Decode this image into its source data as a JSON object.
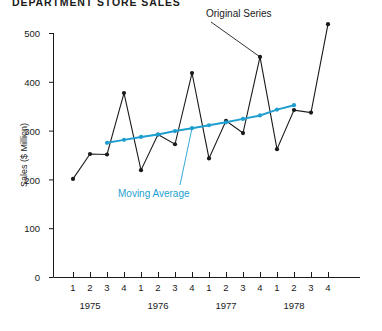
{
  "chart_data": {
    "type": "line",
    "title": "DEPARTMENT STORE SALES",
    "xlabel": "",
    "ylabel": "Sales  ($ Million)",
    "ylim": [
      0,
      500
    ],
    "ytick_values": [
      0,
      100,
      200,
      300,
      400,
      500
    ],
    "ytick_labels": [
      "0",
      "100",
      "200",
      "300",
      "400",
      "500"
    ],
    "grid": false,
    "legend_position": "annotations-inline",
    "categories": [
      "1975 Q1",
      "1975 Q2",
      "1975 Q3",
      "1975 Q4",
      "1976 Q1",
      "1976 Q2",
      "1976 Q3",
      "1976 Q4",
      "1977 Q1",
      "1977 Q2",
      "1977 Q3",
      "1977 Q4",
      "1978 Q1",
      "1978 Q2",
      "1978 Q3",
      "1978 Q4"
    ],
    "quarter_labels": [
      "1",
      "2",
      "3",
      "4",
      "1",
      "2",
      "3",
      "4",
      "1",
      "2",
      "3",
      "4",
      "1",
      "2",
      "3",
      "4"
    ],
    "year_labels": [
      "1975",
      "1976",
      "1977",
      "1978"
    ],
    "series": [
      {
        "name": "Original Series",
        "color": "#1a1a1a",
        "marker": "filled-circle",
        "values": [
          201,
          252,
          251,
          377,
          219,
          292,
          272,
          418,
          243,
          320,
          295,
          451,
          262,
          342,
          337,
          518
        ]
      },
      {
        "name": "Moving Average",
        "color": "#1f9fd0",
        "marker": "filled-circle",
        "start_index": 2,
        "end_index": 13,
        "values": [
          null,
          null,
          275,
          281,
          287,
          292,
          299,
          305,
          311,
          317,
          324,
          331,
          343,
          352,
          null,
          null
        ]
      }
    ],
    "annotations": [
      {
        "text": "Original Series",
        "color": "#1a1a1a",
        "points_to": "1977 Q4"
      },
      {
        "text": "Moving Average",
        "color": "#1f9fd0",
        "points_to": "1976 Q4"
      }
    ]
  },
  "axis": {
    "y_title": "Sales  ($ Million)",
    "y_ticks": [
      "500",
      "400",
      "300",
      "200",
      "100",
      "0"
    ],
    "x_quarters": [
      "1",
      "2",
      "3",
      "4",
      "1",
      "2",
      "3",
      "4",
      "1",
      "2",
      "3",
      "4",
      "1",
      "2",
      "3",
      "4"
    ],
    "x_years": [
      "1975",
      "1976",
      "1977",
      "1978"
    ]
  },
  "header": {
    "title": "DEPARTMENT STORE SALES"
  },
  "annotations": {
    "original_series": "Original Series",
    "moving_average": "Moving Average"
  }
}
